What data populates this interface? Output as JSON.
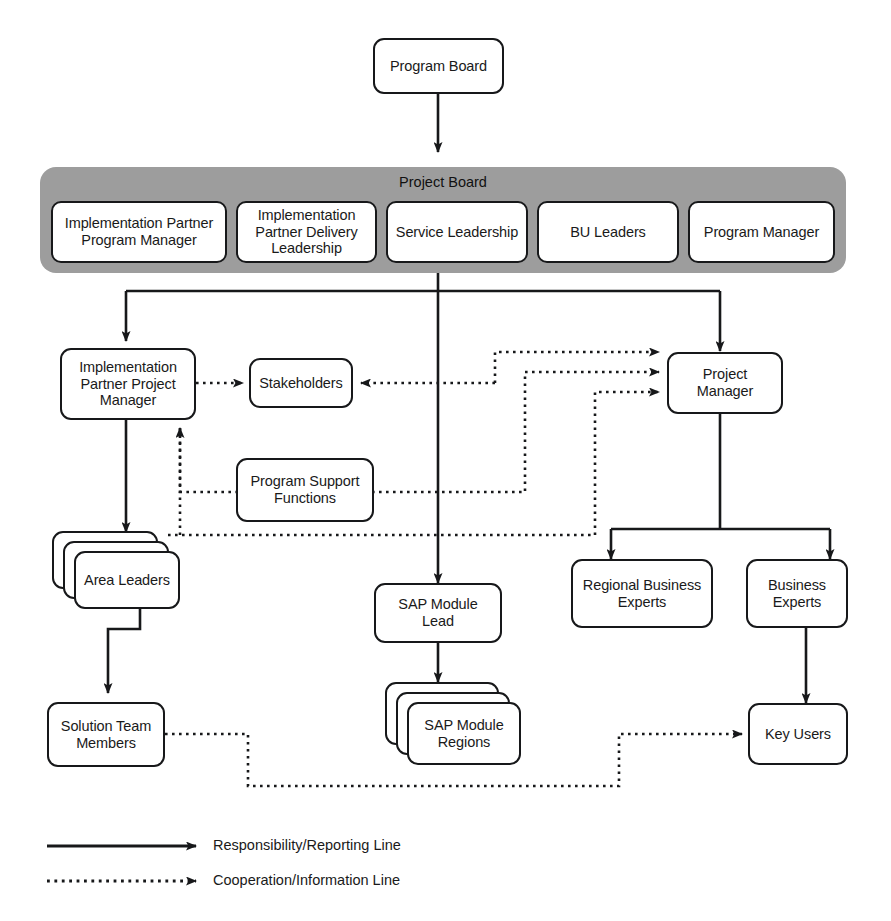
{
  "diagram": {
    "type": "org-chart"
  },
  "nodes": {
    "program_board": "Program Board",
    "project_board_title": "Project Board",
    "impl_partner_program_manager": "Implementation Partner Program Manager",
    "impl_partner_delivery_leadership": "Implementation Partner Delivery Leadership",
    "service_leadership": "Service Leadership",
    "bu_leaders": "BU Leaders",
    "program_manager": "Program Manager",
    "impl_partner_project_manager": "Implementation Partner Project Manager",
    "stakeholders": "Stakeholders",
    "project_manager": "Project Manager",
    "program_support_functions": "Program Support Functions",
    "area_leaders": "Area Leaders",
    "sap_module_lead": "SAP Module Lead",
    "regional_business_experts": "Regional Business Experts",
    "business_experts": "Business Experts",
    "solution_team_members": "Solution Team Members",
    "sap_module_regions": "SAP Module Regions",
    "key_users": "Key Users"
  },
  "legend": {
    "items": [
      {
        "style": "solid",
        "label": "Responsibility/Reporting Line"
      },
      {
        "style": "dotted",
        "label": "Cooperation/Information Line"
      }
    ],
    "solid_label": "Responsibility/Reporting Line",
    "dotted_label": "Cooperation/Information Line"
  },
  "colors": {
    "band_gray": "#9d9d9d",
    "line": "#17181a",
    "node_fill": "#ffffff",
    "text": "#1a1a1a"
  },
  "relationships": {
    "solid": [
      "Program Board -> Project Board",
      "Project Board -> Implementation Partner Project Manager",
      "Project Board -> SAP Module Lead",
      "Project Board -> Project Manager",
      "Implementation Partner Project Manager -> Area Leaders",
      "Area Leaders -> Solution Team Members",
      "SAP Module Lead -> SAP Module Regions",
      "Project Manager -> Regional Business Experts",
      "Project Manager -> Business Experts",
      "Business Experts -> Key Users"
    ],
    "dotted": [
      "Implementation Partner Project Manager -> Stakeholders",
      "Project Manager -> Stakeholders",
      "Program Support Functions -> Implementation Partner Project Manager",
      "Program Support Functions -> Project Manager",
      "Area Leaders -> Implementation Partner Project Manager",
      "Area Leaders -> Project Manager",
      "Solution Team Members -> Key Users"
    ]
  }
}
